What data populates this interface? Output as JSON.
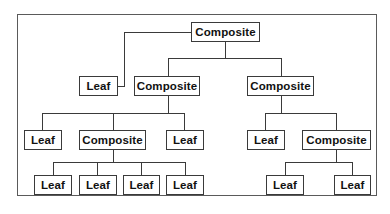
{
  "diagram": {
    "type": "composite-pattern-tree",
    "nodes": [
      {
        "id": "root",
        "label": "Composite",
        "kind": "composite",
        "x": 191,
        "y": 22,
        "w": 69
      },
      {
        "id": "leaf-a",
        "label": "Leaf",
        "kind": "leaf",
        "x": 79,
        "y": 76,
        "w": 39
      },
      {
        "id": "comp-l",
        "label": "Composite",
        "kind": "composite",
        "x": 134,
        "y": 76,
        "w": 66
      },
      {
        "id": "comp-r",
        "label": "Composite",
        "kind": "composite",
        "x": 247,
        "y": 76,
        "w": 67
      },
      {
        "id": "leaf-b",
        "label": "Leaf",
        "kind": "leaf",
        "x": 24,
        "y": 130,
        "w": 38
      },
      {
        "id": "comp-ll",
        "label": "Composite",
        "kind": "composite",
        "x": 79,
        "y": 130,
        "w": 67
      },
      {
        "id": "leaf-c",
        "label": "Leaf",
        "kind": "leaf",
        "x": 166,
        "y": 130,
        "w": 38
      },
      {
        "id": "leaf-d",
        "label": "Leaf",
        "kind": "leaf",
        "x": 247,
        "y": 130,
        "w": 38
      },
      {
        "id": "comp-rr",
        "label": "Composite",
        "kind": "composite",
        "x": 302,
        "y": 130,
        "w": 69
      },
      {
        "id": "leaf-e",
        "label": "Leaf",
        "kind": "leaf",
        "x": 34,
        "y": 175,
        "w": 38
      },
      {
        "id": "leaf-f",
        "label": "Leaf",
        "kind": "leaf",
        "x": 79,
        "y": 175,
        "w": 38
      },
      {
        "id": "leaf-g",
        "label": "Leaf",
        "kind": "leaf",
        "x": 123,
        "y": 175,
        "w": 37
      },
      {
        "id": "leaf-h",
        "label": "Leaf",
        "kind": "leaf",
        "x": 166,
        "y": 175,
        "w": 38
      },
      {
        "id": "leaf-i",
        "label": "Leaf",
        "kind": "leaf",
        "x": 266,
        "y": 175,
        "w": 38
      },
      {
        "id": "leaf-j",
        "label": "Leaf",
        "kind": "leaf",
        "x": 334,
        "y": 175,
        "w": 37
      }
    ],
    "edges": [
      {
        "from": "root",
        "to": "leaf-a"
      },
      {
        "from": "root",
        "to": "comp-l"
      },
      {
        "from": "root",
        "to": "comp-r"
      },
      {
        "from": "comp-l",
        "to": "leaf-b"
      },
      {
        "from": "comp-l",
        "to": "comp-ll"
      },
      {
        "from": "comp-l",
        "to": "leaf-c"
      },
      {
        "from": "comp-r",
        "to": "leaf-d"
      },
      {
        "from": "comp-r",
        "to": "comp-rr"
      },
      {
        "from": "comp-ll",
        "to": "leaf-e"
      },
      {
        "from": "comp-ll",
        "to": "leaf-f"
      },
      {
        "from": "comp-ll",
        "to": "leaf-g"
      },
      {
        "from": "comp-ll",
        "to": "leaf-h"
      },
      {
        "from": "comp-rr",
        "to": "leaf-i"
      },
      {
        "from": "comp-rr",
        "to": "leaf-j"
      }
    ],
    "colors": {
      "line": "#3a3a3a",
      "text": "#111111",
      "background": "#ffffff"
    }
  }
}
